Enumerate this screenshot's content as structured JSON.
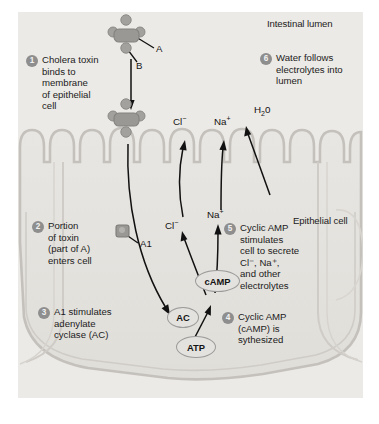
{
  "figure": {
    "title_regions": {
      "lumen_label": "Intestinal lumen",
      "cell_label": "Epithelial cell"
    },
    "colors": {
      "background": "#eceae6",
      "membrane": "#c9c6c1",
      "cytoplasm": "#e4e2de",
      "badge": "#8e8e8e",
      "toxin": "#9c9a96",
      "text": "#1b1b1b"
    }
  },
  "steps": [
    {
      "number": "1",
      "text": "Cholera toxin\nbinds to\nmembrane\nof epithelial\ncell"
    },
    {
      "number": "2",
      "text": "Portion\nof toxin\n(part of A)\nenters cell"
    },
    {
      "number": "3",
      "text": "A1 stimulates\nadenylate\ncyclase (AC)"
    },
    {
      "number": "4",
      "text": "Cyclic AMP\n(cAMP) is\nsythesized"
    },
    {
      "number": "5",
      "text": "Cyclic AMP\nstimulates\ncell to secrete\nCl⁻, Na⁺,\nand other\nelectrolytes"
    },
    {
      "number": "6",
      "text": "Water follows\nelectrolytes into\nlumen"
    }
  ],
  "toxin_subunits": {
    "a_label": "A",
    "b_label": "B",
    "a1_label": "A1"
  },
  "ions": {
    "lumen": [
      {
        "name": "chloride",
        "symbol": "Cl",
        "charge": "−"
      },
      {
        "name": "sodium",
        "symbol": "Na",
        "charge": "+"
      },
      {
        "name": "water",
        "symbol": "H",
        "subscript": "2",
        "suffix": "0"
      }
    ],
    "cytoplasm": [
      {
        "name": "chloride",
        "symbol": "Cl",
        "charge": "−"
      },
      {
        "name": "sodium",
        "symbol": "Na",
        "charge": "+"
      }
    ]
  },
  "molecules": [
    {
      "id": "ac",
      "label": "AC"
    },
    {
      "id": "camp",
      "label": "cAMP"
    },
    {
      "id": "atp",
      "label": "ATP"
    }
  ]
}
